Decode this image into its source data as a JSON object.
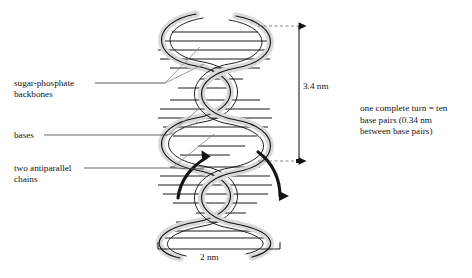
{
  "diagram": {
    "type": "dna-double-helix-schematic",
    "background_color": "#ffffff",
    "ink_color": "#141414",
    "ribbon_fill": "#d9d9d9",
    "leader_color": "#6e6e6e"
  },
  "labels": {
    "backbones": "sugar-phosphate\nbackbones",
    "bases": "bases",
    "chains": "two antiparallel\nchains",
    "turn_note": "one complete turn = ten\nbase pairs (0.34 nm\nbetween base pairs)"
  },
  "dimensions": {
    "helix_height": "3.4 nm",
    "helix_width": "2 nm"
  },
  "annotations": {
    "strand_direction_up": "up-arrow-left-strand",
    "strand_direction_down": "down-arrow-right-strand"
  }
}
